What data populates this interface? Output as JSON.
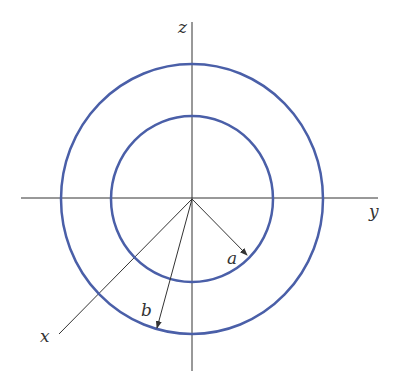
{
  "diagram": {
    "title": "",
    "colors": {
      "circle": "#4a5fa8",
      "axis": "#333333",
      "background": "#ffffff"
    },
    "axes": {
      "z": {
        "label": "z"
      },
      "y": {
        "label": "y"
      },
      "x": {
        "label": "x"
      }
    },
    "circles": [
      {
        "name": "inner",
        "radius_label": "a"
      },
      {
        "name": "outer",
        "radius_label": "b"
      }
    ]
  }
}
